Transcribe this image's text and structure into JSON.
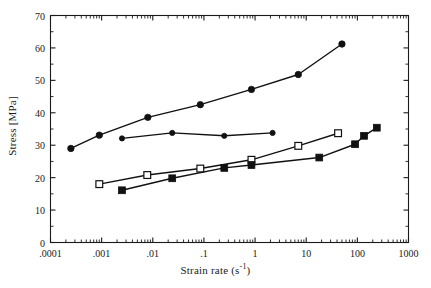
{
  "chart_data": {
    "type": "line",
    "title": "",
    "xlabel": "Strain rate  (s-1)",
    "xlabel_base": "Strain rate  (s",
    "xlabel_sup": "-1",
    "xlabel_tail": ")",
    "ylabel": "Stress [MPa]",
    "xscale": "log",
    "yscale": "linear",
    "xlim": [
      0.0001,
      1000
    ],
    "ylim": [
      0,
      70
    ],
    "grid": false,
    "legend": "none",
    "xticks": [
      {
        "value": 0.0001,
        "label": ".0001"
      },
      {
        "value": 0.001,
        "label": ".001"
      },
      {
        "value": 0.01,
        "label": ".01"
      },
      {
        "value": 0.1,
        "label": ".1"
      },
      {
        "value": 1,
        "label": "1"
      },
      {
        "value": 10,
        "label": "10"
      },
      {
        "value": 100,
        "label": "100"
      },
      {
        "value": 1000,
        "label": "1000"
      }
    ],
    "yticks": [
      {
        "value": 0,
        "label": "0"
      },
      {
        "value": 10,
        "label": "10"
      },
      {
        "value": 20,
        "label": "20"
      },
      {
        "value": 30,
        "label": "30"
      },
      {
        "value": 40,
        "label": "40"
      },
      {
        "value": 50,
        "label": "50"
      },
      {
        "value": 60,
        "label": "60"
      },
      {
        "value": 70,
        "label": "70"
      }
    ],
    "yticks_minor": [
      5,
      15,
      25,
      35,
      45,
      55,
      65
    ],
    "series": [
      {
        "name": "series-1-upper",
        "marker": "filled-circle",
        "marker_size": 3.2,
        "color": "#111111",
        "points": [
          {
            "x": 0.00025,
            "y": 29.0
          },
          {
            "x": 0.0009,
            "y": 33.1
          },
          {
            "x": 0.008,
            "y": 38.6
          },
          {
            "x": 0.085,
            "y": 42.5
          },
          {
            "x": 0.85,
            "y": 47.2
          },
          {
            "x": 7.0,
            "y": 51.8
          },
          {
            "x": 50.0,
            "y": 61.2
          }
        ]
      },
      {
        "name": "series-2-flat",
        "marker": "filled-circle",
        "marker_size": 2.6,
        "color": "#111111",
        "points": [
          {
            "x": 0.0025,
            "y": 32.1
          },
          {
            "x": 0.024,
            "y": 33.8
          },
          {
            "x": 0.25,
            "y": 32.9
          },
          {
            "x": 2.2,
            "y": 33.8
          }
        ]
      },
      {
        "name": "series-3-open-square",
        "marker": "open-square",
        "marker_size": 3.4,
        "color": "#111111",
        "points": [
          {
            "x": 0.0009,
            "y": 18.0
          },
          {
            "x": 0.0078,
            "y": 20.8
          },
          {
            "x": 0.085,
            "y": 22.8
          },
          {
            "x": 0.85,
            "y": 25.5
          },
          {
            "x": 7.0,
            "y": 29.8
          },
          {
            "x": 42.0,
            "y": 33.7
          }
        ]
      },
      {
        "name": "series-4-filled-square",
        "marker": "filled-square",
        "marker_size": 3.4,
        "color": "#111111",
        "points": [
          {
            "x": 0.0025,
            "y": 16.1
          },
          {
            "x": 0.024,
            "y": 19.8
          },
          {
            "x": 0.25,
            "y": 23.0
          },
          {
            "x": 0.85,
            "y": 23.9
          },
          {
            "x": 18.0,
            "y": 26.2
          },
          {
            "x": 90.0,
            "y": 30.3
          },
          {
            "x": 135.0,
            "y": 32.9
          },
          {
            "x": 240.0,
            "y": 35.4
          }
        ]
      }
    ]
  },
  "style": {
    "axis_color": "#1a1a1a",
    "line_color": "#111111",
    "background": "#ffffff"
  }
}
